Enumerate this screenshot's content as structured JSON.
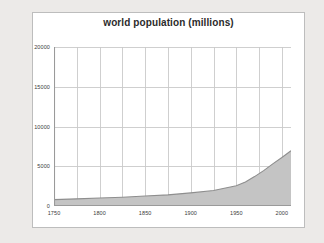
{
  "frame": {
    "background_color": "#ffffff",
    "border_color": "#bdbdbd"
  },
  "page": {
    "background_color": "#eceae8"
  },
  "chart_data": {
    "type": "area",
    "title": "world population (millions)",
    "xlabel": "",
    "ylabel": "",
    "xlim": [
      1750,
      2010
    ],
    "ylim": [
      0,
      20000
    ],
    "grid": true,
    "legend": "none",
    "axis_color": "#9a9a9a",
    "grid_color": "#c9c9c9",
    "series_fill_color": "#c4c4c4",
    "series_line_color": "#8e8e8e",
    "ytick_labels": [
      "0",
      "5000",
      "10000",
      "15000",
      "20000"
    ],
    "ytick_values": [
      0,
      5000,
      10000,
      15000,
      20000
    ],
    "xtick_labels": [
      "1750",
      "1800",
      "1850",
      "1900",
      "1950",
      "2000"
    ],
    "xtick_values": [
      1750,
      1800,
      1850,
      1900,
      1950,
      2000
    ],
    "x_minor_step": 25,
    "series": [
      {
        "name": "world population",
        "x": [
          1750,
          1775,
          1800,
          1825,
          1850,
          1875,
          1900,
          1925,
          1950,
          1960,
          1970,
          1980,
          1990,
          2000,
          2010
        ],
        "values": [
          800,
          900,
          1000,
          1100,
          1250,
          1400,
          1650,
          1950,
          2550,
          3030,
          3700,
          4450,
          5300,
          6100,
          6950
        ]
      }
    ]
  }
}
